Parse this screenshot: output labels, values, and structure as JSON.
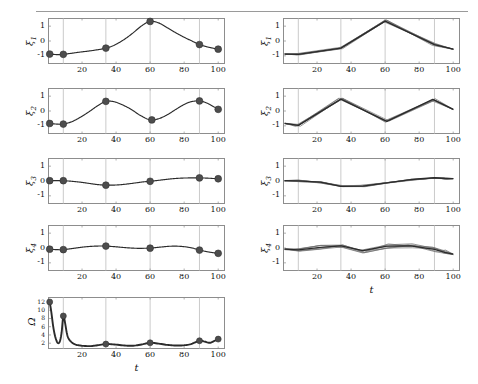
{
  "figure": {
    "width": 478,
    "height": 384,
    "background": "#ffffff",
    "rule_color": "#9a9a9a",
    "axis_color": "#8d8d8d",
    "grid_color": "#b4b4b4",
    "curve_color": "#2b2b2b",
    "marker_color": "#4d4d4d",
    "ensemble_color": "#6f6f6f",
    "xlabel": "t",
    "columns": [
      {
        "name": "left-column",
        "description": "smooth interpolant with knot markers"
      },
      {
        "name": "right-column",
        "description": "ensemble of sampled trajectories"
      }
    ]
  },
  "axes": {
    "x_ticks": [
      20,
      40,
      60,
      80,
      100
    ],
    "x_tick_labels": [
      "20",
      "40",
      "60",
      "80",
      "100"
    ],
    "xlim": [
      0,
      104
    ],
    "y_ticks": [
      1,
      0,
      -1
    ],
    "y_tick_labels": [
      "1",
      "0",
      "-1"
    ],
    "ylim": [
      -1.55,
      1.55
    ],
    "omega_y_ticks": [
      2,
      4,
      6,
      8,
      10,
      12
    ],
    "omega_y_tick_labels": [
      "2",
      "4",
      "6",
      "8",
      "10",
      "12"
    ],
    "omega_ylim": [
      0.6,
      13.2
    ]
  },
  "chart_data": [
    {
      "type": "line",
      "name": "xi1-left",
      "panel": "left",
      "row": 1,
      "ylabel": "ξ",
      "ylabel_sub": "1",
      "xlabel": "",
      "xlim": [
        0,
        104
      ],
      "ylim": [
        -1.55,
        1.55
      ],
      "grid": true,
      "x": [
        1,
        3,
        6,
        9,
        13,
        18,
        23,
        28,
        34,
        39,
        45,
        50,
        55,
        60,
        65,
        70,
        75,
        80,
        84,
        89,
        93,
        96,
        100
      ],
      "y": [
        -0.88,
        -0.9,
        -0.92,
        -0.9,
        -0.84,
        -0.76,
        -0.69,
        -0.61,
        -0.48,
        -0.28,
        0.12,
        0.55,
        1.02,
        1.32,
        1.22,
        0.9,
        0.56,
        0.25,
        0.03,
        -0.24,
        -0.38,
        -0.46,
        -0.55
      ],
      "markers_x": [
        1,
        9,
        34,
        60,
        89,
        100
      ],
      "markers_y": [
        -0.88,
        -0.9,
        -0.48,
        1.32,
        -0.24,
        -0.55
      ]
    },
    {
      "type": "line",
      "name": "xi2-left",
      "panel": "left",
      "row": 2,
      "ylabel": "ξ",
      "ylabel_sub": "2",
      "xlabel": "",
      "xlim": [
        0,
        104
      ],
      "ylim": [
        -1.55,
        1.55
      ],
      "grid": true,
      "x": [
        1,
        5,
        9,
        14,
        19,
        24,
        29,
        34,
        39,
        44,
        49,
        54,
        60,
        65,
        70,
        75,
        80,
        84,
        89,
        94,
        100
      ],
      "y": [
        -0.84,
        -0.88,
        -0.88,
        -0.72,
        -0.42,
        -0.06,
        0.34,
        0.65,
        0.62,
        0.4,
        0.1,
        -0.28,
        -0.6,
        -0.52,
        -0.26,
        0.1,
        0.44,
        0.62,
        0.68,
        0.5,
        0.11
      ],
      "markers_x": [
        1,
        9,
        34,
        61,
        89,
        100
      ],
      "markers_y": [
        -0.84,
        -0.88,
        0.65,
        -0.6,
        0.68,
        0.11
      ]
    },
    {
      "type": "line",
      "name": "xi3-left",
      "panel": "left",
      "row": 3,
      "ylabel": "ξ",
      "ylabel_sub": "3",
      "xlabel": "",
      "xlim": [
        0,
        104
      ],
      "ylim": [
        -1.55,
        1.55
      ],
      "grid": true,
      "x": [
        1,
        5,
        9,
        14,
        19,
        24,
        29,
        34,
        40,
        46,
        52,
        56,
        60,
        66,
        72,
        78,
        84,
        89,
        94,
        100
      ],
      "y": [
        0.02,
        0.03,
        0.02,
        -0.02,
        -0.08,
        -0.16,
        -0.24,
        -0.28,
        -0.27,
        -0.21,
        -0.12,
        -0.06,
        -0.02,
        0.06,
        0.14,
        0.19,
        0.21,
        0.21,
        0.19,
        0.15
      ],
      "markers_x": [
        1,
        9,
        34,
        60,
        89,
        100
      ],
      "markers_y": [
        0.02,
        0.02,
        -0.28,
        -0.02,
        0.21,
        0.15
      ]
    },
    {
      "type": "line",
      "name": "xi4-left",
      "panel": "left",
      "row": 4,
      "ylabel": "ξ",
      "ylabel_sub": "4",
      "xlabel": "",
      "xlim": [
        0,
        104
      ],
      "ylim": [
        -1.55,
        1.55
      ],
      "grid": true,
      "x": [
        1,
        5,
        9,
        14,
        19,
        24,
        29,
        34,
        40,
        46,
        52,
        56,
        60,
        66,
        72,
        78,
        84,
        89,
        94,
        100
      ],
      "y": [
        -0.08,
        -0.11,
        -0.11,
        -0.04,
        0.04,
        0.1,
        0.13,
        0.13,
        0.08,
        0.02,
        -0.02,
        -0.02,
        -0.01,
        0.06,
        0.12,
        0.11,
        0.02,
        -0.14,
        -0.26,
        -0.36
      ],
      "markers_x": [
        1,
        9,
        34,
        60,
        89,
        100
      ],
      "markers_y": [
        -0.08,
        -0.11,
        0.13,
        -0.01,
        -0.14,
        -0.36
      ]
    },
    {
      "type": "line",
      "name": "omega-left",
      "panel": "left",
      "row": 5,
      "ylabel": "Ω",
      "ylabel_sub": "",
      "xlabel": "t",
      "xlim": [
        0,
        104
      ],
      "ylim": [
        0.6,
        13.2
      ],
      "grid": true,
      "x": [
        1,
        2,
        3,
        4,
        5,
        6,
        7,
        8,
        9,
        10,
        11,
        12,
        14,
        16,
        18,
        21,
        25,
        29,
        34,
        39,
        45,
        50,
        55,
        60,
        65,
        70,
        75,
        80,
        84,
        89,
        92,
        95,
        97,
        100
      ],
      "y": [
        12.0,
        9.4,
        6.2,
        4.0,
        2.6,
        2.0,
        2.5,
        4.6,
        8.6,
        7.0,
        4.6,
        3.2,
        2.2,
        1.7,
        1.5,
        1.35,
        1.3,
        1.5,
        1.8,
        1.7,
        1.45,
        1.4,
        1.7,
        2.1,
        1.9,
        1.6,
        1.45,
        1.5,
        1.8,
        2.6,
        2.4,
        2.1,
        2.4,
        3.0
      ],
      "markers_x": [
        1,
        9,
        34,
        60,
        89,
        100
      ],
      "markers_y": [
        12.0,
        8.6,
        1.8,
        2.1,
        2.6,
        3.0
      ]
    },
    {
      "type": "line",
      "name": "xi1-right",
      "panel": "right",
      "row": 1,
      "ylabel": "ξ",
      "ylabel_sub": "1",
      "xlabel": "",
      "xlim": [
        0,
        104
      ],
      "ylim": [
        -1.55,
        1.55
      ],
      "grid": true,
      "ensemble_members": 6,
      "x": [
        1,
        9,
        34,
        60,
        89,
        100
      ],
      "y": [
        -0.88,
        -0.9,
        -0.48,
        1.34,
        -0.24,
        -0.55
      ]
    },
    {
      "type": "line",
      "name": "xi2-right",
      "panel": "right",
      "row": 2,
      "ylabel": "ξ",
      "ylabel_sub": "2",
      "xlabel": "",
      "xlim": [
        0,
        104
      ],
      "ylim": [
        -1.55,
        1.55
      ],
      "grid": true,
      "ensemble_members": 6,
      "x": [
        1,
        9,
        34,
        61,
        88,
        100
      ],
      "y": [
        -0.84,
        -0.97,
        0.8,
        -0.7,
        0.78,
        0.11
      ]
    },
    {
      "type": "line",
      "name": "xi3-right",
      "panel": "right",
      "row": 3,
      "ylabel": "ξ",
      "ylabel_sub": "3",
      "xlabel": "",
      "xlim": [
        0,
        104
      ],
      "ylim": [
        -1.55,
        1.55
      ],
      "grid": true,
      "ensemble_members": 6,
      "x": [
        1,
        9,
        22,
        34,
        47,
        61,
        75,
        89,
        95,
        100
      ],
      "y": [
        0.02,
        0.01,
        -0.08,
        -0.36,
        -0.34,
        -0.12,
        0.1,
        0.22,
        0.17,
        0.16
      ]
    },
    {
      "type": "line",
      "name": "xi4-right",
      "panel": "right",
      "row": 4,
      "ylabel": "ξ",
      "ylabel_sub": "4",
      "xlabel": "t",
      "xlim": [
        0,
        104
      ],
      "ylim": [
        -1.55,
        1.55
      ],
      "grid": true,
      "ensemble_members": 6,
      "x": [
        1,
        9,
        22,
        34,
        47,
        61,
        75,
        89,
        95,
        100
      ],
      "y": [
        -0.08,
        -0.12,
        0.04,
        0.14,
        -0.18,
        0.12,
        0.14,
        -0.1,
        -0.3,
        -0.42
      ]
    }
  ]
}
